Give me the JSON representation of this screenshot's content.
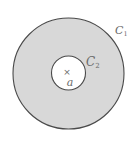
{
  "figure": {
    "colors": {
      "background": "#ffffff",
      "annulus_fill": "#d8d8d8",
      "inner_fill": "#ffffff",
      "stroke": "#4a4a4a",
      "label": "#6a6a6a"
    },
    "outer_contour": {
      "label_main": "C",
      "label_sub": "1",
      "cx": 68.5,
      "cy": 73.5,
      "r": 55.5
    },
    "inner_contour": {
      "label_main": "C",
      "label_sub": "2",
      "cx": 68.5,
      "cy": 73,
      "r": 17
    },
    "point": {
      "marker": "×",
      "label": "a"
    }
  }
}
